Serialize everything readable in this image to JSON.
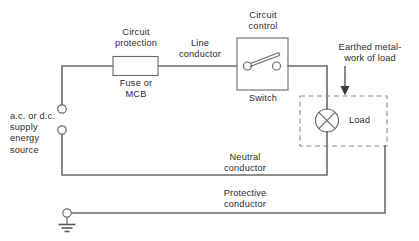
{
  "diagram": {
    "colors": {
      "wire": "#6b6b6b",
      "outline": "#6b6b6b",
      "dashed_enclosure": "#8a8a8a",
      "text": "#2b2b2b",
      "pointer": "#3a3a3a",
      "background": "#ffffff"
    },
    "labels": {
      "circuit_protection": "Circuit\nprotection",
      "fuse_or_mcb": "Fuse or\nMCB",
      "line_conductor": "Line\nconductor",
      "circuit_control": "Circuit\ncontrol",
      "switch": "Switch",
      "earthed_metalwork": "Earthed metal-\nwork of load",
      "load": "Load",
      "supply_source": "a.c. or d.c.\nsupply\nenergy\nsource",
      "neutral_conductor": "Neutral\nconductor",
      "protective_conductor": "Protective\nconductor"
    },
    "symbols": {
      "fuse": "fuse-rectangle-symbol",
      "switch": "single-pole-switch-symbol",
      "lamp": "lamp-crossed-circle-symbol",
      "earth": "earth-ground-symbol",
      "supply_terminal_line": "line-supply-terminal",
      "supply_terminal_neutral": "neutral-supply-terminal",
      "earth_terminal": "protective-earth-terminal",
      "pointer_arrow": "down-arrow-pointer"
    }
  }
}
